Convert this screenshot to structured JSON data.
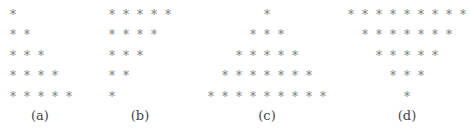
{
  "symbol": "*",
  "panels": [
    {
      "label": "(a)",
      "rows": [
        1,
        2,
        3,
        4,
        5
      ],
      "align": "left"
    },
    {
      "label": "(b)",
      "rows": [
        5,
        4,
        3,
        2,
        1
      ],
      "align": "left"
    },
    {
      "label": "(c)",
      "rows": [
        1,
        3,
        5,
        7,
        9
      ],
      "align": "center"
    },
    {
      "label": "(d)",
      "rows": [
        9,
        7,
        5,
        3,
        1
      ],
      "align": "center"
    }
  ]
}
